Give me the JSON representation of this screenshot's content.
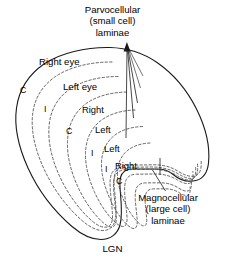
{
  "figure": {
    "name": "LGN laminae cross-section diagram",
    "caption": "LGN",
    "background_color": "#ffffff",
    "outline_color": "#1a1a1a",
    "lamina_color": "#4a4a4a",
    "text_color": "#000000"
  },
  "callouts": {
    "parvocellular": {
      "line1": "Parvocellular",
      "line2": "(small cell)",
      "line3": "laminae"
    },
    "magnocellular": {
      "line1": "Magnocellular",
      "line2": "(large cell)",
      "line3": "laminae"
    }
  },
  "laminae_labels": [
    {
      "id": "right-eye",
      "text": "Right eye"
    },
    {
      "id": "left-eye",
      "text": "Left eye"
    },
    {
      "id": "right-1",
      "text": "Right"
    },
    {
      "id": "left-1",
      "text": "Left"
    },
    {
      "id": "left-2",
      "text": "Left"
    },
    {
      "id": "right-2",
      "text": "Right"
    }
  ],
  "eye_letters": [
    {
      "id": "c-1",
      "text": "C"
    },
    {
      "id": "i-1",
      "text": "I"
    },
    {
      "id": "c-2",
      "text": "C"
    },
    {
      "id": "i-2",
      "text": "I"
    },
    {
      "id": "i-3",
      "text": "I"
    },
    {
      "id": "c-3",
      "text": "C"
    }
  ],
  "caption": {
    "label": "LGN"
  }
}
